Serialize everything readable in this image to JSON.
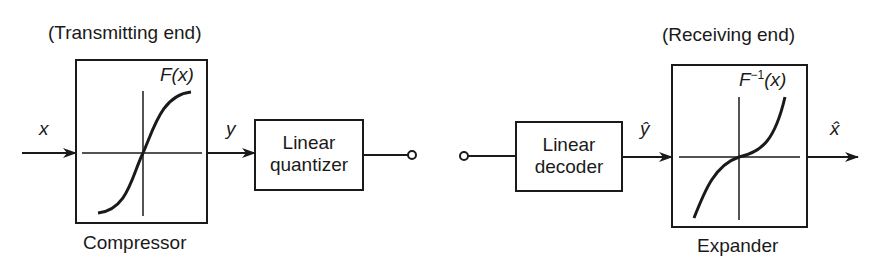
{
  "diagram": {
    "transmitting_label": "(Transmitting end)",
    "receiving_label": "(Receiving end)",
    "signals": {
      "x": "x",
      "y": "y",
      "y_hat": "ŷ",
      "x_hat": "x̂"
    },
    "blocks": {
      "compressor": {
        "caption": "Compressor",
        "function": "F(x)"
      },
      "quantizer": {
        "line1": "Linear",
        "line2": "quantizer"
      },
      "decoder": {
        "line1": "Linear",
        "line2": "decoder"
      },
      "expander": {
        "caption": "Expander",
        "function_base": "F",
        "function_sup": "−1",
        "function_arg": "(x)"
      }
    }
  }
}
